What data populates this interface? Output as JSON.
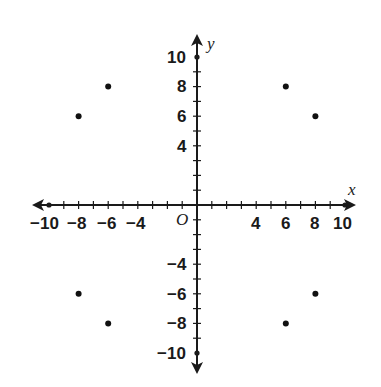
{
  "chart_data": {
    "type": "scatter",
    "title": "",
    "xlabel": "x",
    "ylabel": "y",
    "origin_label": "O",
    "xlim": [
      -10,
      10
    ],
    "ylim": [
      -10,
      10
    ],
    "grid": false,
    "x_tick_labels": [
      "-10",
      "-8",
      "-6",
      "-4",
      "4",
      "6",
      "8",
      "10"
    ],
    "y_tick_labels": [
      "10",
      "8",
      "6",
      "4",
      "-4",
      "-6",
      "-8",
      "-10"
    ],
    "points": [
      {
        "x": -6,
        "y": 8
      },
      {
        "x": -8,
        "y": 6
      },
      {
        "x": 6,
        "y": 8
      },
      {
        "x": 8,
        "y": 6
      },
      {
        "x": -8,
        "y": -6
      },
      {
        "x": -6,
        "y": -8
      },
      {
        "x": 6,
        "y": -8
      },
      {
        "x": 8,
        "y": -6
      }
    ]
  },
  "labels": {
    "x_axis": "x",
    "y_axis": "y",
    "origin": "O",
    "xt": {
      "m10": "−10",
      "m8": "−8",
      "m6": "−6",
      "m4": "−4",
      "p4": "4",
      "p6": "6",
      "p8": "8",
      "p10": "10"
    },
    "yt": {
      "p10": "10",
      "p8": "8",
      "p6": "6",
      "p4": "4",
      "m4": "−4",
      "m6": "−6",
      "m8": "−8",
      "m10": "−10"
    }
  }
}
